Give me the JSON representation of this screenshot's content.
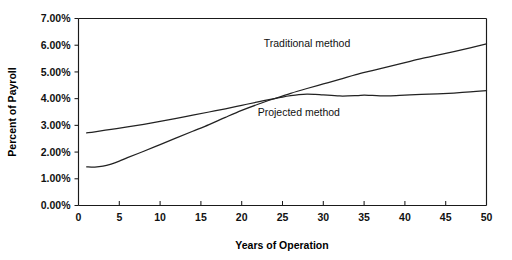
{
  "chart_data": {
    "type": "line",
    "title": "",
    "xlabel": "Years of Operation",
    "ylabel": "Percent of Payroll",
    "xlim": [
      0,
      50
    ],
    "ylim": [
      0,
      7
    ],
    "grid": false,
    "legend_position": "inline-annotation",
    "x_ticks": [
      "0",
      "5",
      "10",
      "15",
      "20",
      "25",
      "30",
      "35",
      "40",
      "45",
      "50"
    ],
    "x_tick_values": [
      0,
      5,
      10,
      15,
      20,
      25,
      30,
      35,
      40,
      45,
      50
    ],
    "y_ticks": [
      "0.00%",
      "1.00%",
      "2.00%",
      "3.00%",
      "4.00%",
      "5.00%",
      "6.00%",
      "7.00%"
    ],
    "y_tick_values": [
      0,
      1,
      2,
      3,
      4,
      5,
      6,
      7
    ],
    "series": [
      {
        "name": "Traditional method",
        "label_x": 28,
        "label_y": 5.95,
        "x": [
          1,
          2,
          3,
          4,
          5,
          6,
          8,
          10,
          12,
          14,
          16,
          18,
          20,
          22,
          24,
          26,
          28,
          30,
          32,
          34,
          36,
          38,
          40,
          42,
          44,
          46,
          48,
          50
        ],
        "values": [
          1.45,
          1.44,
          1.47,
          1.55,
          1.66,
          1.79,
          2.03,
          2.28,
          2.53,
          2.78,
          3.03,
          3.3,
          3.56,
          3.79,
          4.0,
          4.2,
          4.38,
          4.55,
          4.72,
          4.9,
          5.05,
          5.2,
          5.35,
          5.5,
          5.63,
          5.76,
          5.9,
          6.05
        ]
      },
      {
        "name": "Projected method",
        "label_x": 27,
        "label_y": 3.35,
        "x": [
          1,
          2,
          4,
          6,
          8,
          10,
          12,
          14,
          16,
          18,
          20,
          22,
          24,
          25,
          26,
          27,
          28,
          29,
          30,
          32,
          34,
          35,
          36,
          38,
          40,
          42,
          44,
          46,
          48,
          50
        ],
        "values": [
          2.72,
          2.76,
          2.85,
          2.94,
          3.04,
          3.15,
          3.26,
          3.38,
          3.5,
          3.62,
          3.75,
          3.88,
          4.0,
          4.06,
          4.11,
          4.15,
          4.17,
          4.16,
          4.14,
          4.1,
          4.11,
          4.13,
          4.12,
          4.1,
          4.13,
          4.16,
          4.18,
          4.21,
          4.25,
          4.3
        ]
      }
    ],
    "annotations": [
      {
        "text": "Traditional method",
        "x": 28,
        "y": 5.95
      },
      {
        "text": "Projected method",
        "x": 27,
        "y": 3.35
      }
    ],
    "colors": {
      "axis": "#1a1a1a",
      "series_traditional": "#222222",
      "series_projected": "#222222",
      "background": "#ffffff"
    }
  }
}
